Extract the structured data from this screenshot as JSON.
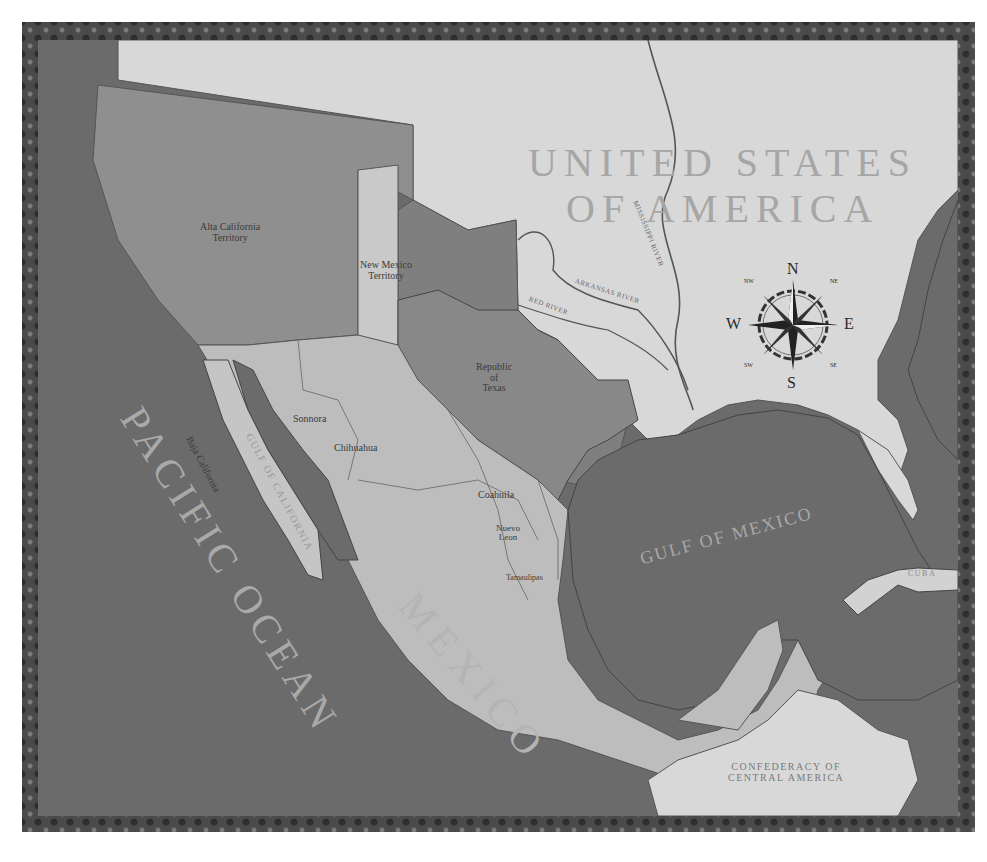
{
  "map": {
    "title": "Mexico and the Republic of Texas",
    "regions": {
      "usa": "UNITED STATES",
      "usa_line2": "OF AMERICA",
      "alta_california": "Alta California",
      "alta_california_2": "Territory",
      "new_mexico": "New Mexico",
      "new_mexico_2": "Territory",
      "texas": "Republic",
      "texas_2": "of",
      "texas_3": "Texas",
      "sonora": "Sonnora",
      "baja_california": "Baja California",
      "chihuahua": "Chihuahua",
      "coahuila": "Coahuila",
      "nuevo_leon": "Nuevo",
      "nuevo_leon_2": "Leon",
      "tamaulipas": "Tamaulipas",
      "mexico": "MEXICO",
      "central_america": "CONFEDERACY OF",
      "central_america_2": "CENTRAL AMERICA",
      "cuba": "CUBA"
    },
    "water": {
      "pacific": "PACIFIC OCEAN",
      "gulf": "GULF OF MEXICO",
      "gulf_of_california": "GULF OF CALIFORNIA"
    },
    "rivers": {
      "mississippi": "MISSISSIPPI RIVER",
      "arkansas": "ARKANSAS RIVER",
      "red": "RED RIVER"
    },
    "compass": {
      "n": "N",
      "s": "S",
      "e": "E",
      "w": "W",
      "ne": "NE",
      "nw": "NW",
      "se": "SE",
      "sw": "SW"
    },
    "colors": {
      "ocean": "#6b6b6b",
      "usa": "#d8d8d8",
      "mexico_light": "#bdbdbd",
      "territory_dark": "#8f8f8f",
      "new_mexico": "#c9c9c9",
      "texas": "#8a8a8a",
      "border": "#4a4a4a"
    }
  }
}
